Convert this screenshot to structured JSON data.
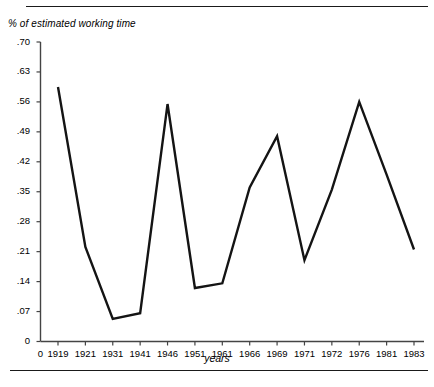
{
  "figure": {
    "y_axis_title": "% of estimated working time",
    "x_axis_title": "years"
  },
  "chart_data": {
    "type": "line",
    "title": "",
    "subtitle": "",
    "xlabel": "years",
    "ylabel": "% of estimated working time",
    "grid": false,
    "legend": null,
    "ylim": [
      0,
      0.7
    ],
    "ytick_labels": [
      ".70",
      ".63",
      ".56",
      ".49",
      ".42",
      ".35",
      ".28",
      ".21",
      ".14",
      ".07",
      "0"
    ],
    "ytick_values": [
      0.7,
      0.63,
      0.56,
      0.49,
      0.42,
      0.35,
      0.28,
      0.21,
      0.14,
      0.07,
      0
    ],
    "categories": [
      "1919",
      "1921",
      "1931",
      "1941",
      "1946",
      "1951",
      "1961",
      "1966",
      "1969",
      "1971",
      "1972",
      "1976",
      "1981",
      "1983"
    ],
    "values": [
      0.595,
      0.221,
      0.053,
      0.066,
      0.555,
      0.125,
      0.136,
      0.36,
      0.48,
      0.19,
      0.355,
      0.56,
      0.39,
      0.215
    ],
    "series": [
      {
        "name": "% of estimated working time",
        "values": [
          0.595,
          0.221,
          0.053,
          0.066,
          0.555,
          0.125,
          0.136,
          0.36,
          0.48,
          0.19,
          0.355,
          0.56,
          0.39,
          0.215
        ]
      }
    ],
    "line_color": "#141414",
    "line_width": 2.4
  }
}
